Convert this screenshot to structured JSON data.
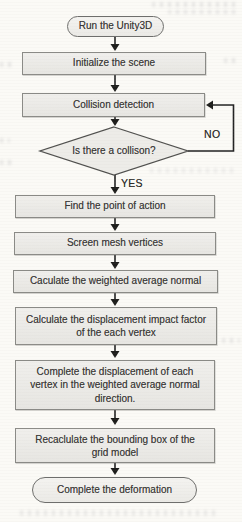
{
  "figure": {
    "type": "flowchart",
    "nodes": [
      {
        "shape": "terminator",
        "label": "Run the Unity3D"
      },
      {
        "shape": "process",
        "label": "Initialize the scene"
      },
      {
        "shape": "process",
        "label": "Collision detection"
      },
      {
        "shape": "decision",
        "label": "Is there a collison?"
      },
      {
        "shape": "process",
        "label": "Find the point of action"
      },
      {
        "shape": "process",
        "label": "Screen mesh vertices"
      },
      {
        "shape": "process",
        "label": "Caculate the weighted average normal"
      },
      {
        "shape": "process",
        "label": "Calculate the displacement impact factor of the each vertex"
      },
      {
        "shape": "process",
        "label": "Complete the displacement of each vertex in the weighted average normal direction."
      },
      {
        "shape": "process",
        "label": "Recaclulate the bounding box of the grid model"
      },
      {
        "shape": "terminator",
        "label": "Complete the deformation"
      }
    ],
    "edge_labels": {
      "yes": "YES",
      "no": "NO"
    },
    "colors": {
      "node_fill": "#e9e8e4",
      "node_border": "#8a8a86",
      "terminator_border": "#6e6e6c",
      "decision_border": "#4f4f4d",
      "connector": "#222222",
      "text": "#3b3a38",
      "background": "#fbfaf6"
    }
  }
}
